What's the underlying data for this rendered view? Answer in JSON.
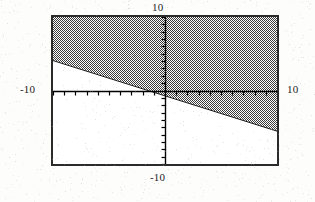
{
  "figure": {
    "name": "inequality-region-plot",
    "frame": {
      "x": 51,
      "y": 15,
      "width": 228,
      "height": 151,
      "border_color": "#2b2b2b",
      "background_color": "#ffffff"
    },
    "labels": {
      "top": "10",
      "bottom": "-10",
      "left": "-10",
      "right": "10"
    }
  },
  "chart_data": {
    "type": "area",
    "title": "",
    "subtitle": "",
    "xlabel": "",
    "ylabel": "",
    "xlim": [
      -10,
      10
    ],
    "ylim": [
      -10,
      10
    ],
    "xticks": [
      -10,
      -9,
      -8,
      -7,
      -6,
      -5,
      -4,
      -3,
      -2,
      -1,
      0,
      1,
      2,
      3,
      4,
      5,
      6,
      7,
      8,
      9,
      10
    ],
    "yticks": [
      -10,
      -9,
      -8,
      -7,
      -6,
      -5,
      -4,
      -3,
      -2,
      -1,
      0,
      1,
      2,
      3,
      4,
      5,
      6,
      7,
      8,
      9,
      10
    ],
    "tick_labels": {
      "x_min": "-10",
      "x_max": "10",
      "y_min": "-10",
      "y_max": "10"
    },
    "grid": false,
    "legend": null,
    "axes": {
      "x_axis_y_value": 0,
      "y_axis_x_value": 0,
      "axis_color": "#000000",
      "tick_direction": "inward",
      "x_tick_count": 21,
      "y_tick_count": 21
    },
    "series": [
      {
        "name": "boundary-line",
        "type": "line",
        "slope": -0.48,
        "intercept": -0.66,
        "points": [
          {
            "x": -10,
            "y": 4.14
          },
          {
            "x": 0,
            "y": -0.66
          },
          {
            "x": 10,
            "y": -5.46
          }
        ],
        "color": "#111111",
        "style": "solid"
      },
      {
        "name": "shaded-region",
        "type": "region",
        "inequality": "y >= -0.48x - 0.66",
        "side": "above",
        "fill_pattern": "checkerboard-dither-50",
        "fill_color": "#3a3a3a",
        "fill_background": "#ffffff"
      }
    ],
    "annotations": []
  }
}
